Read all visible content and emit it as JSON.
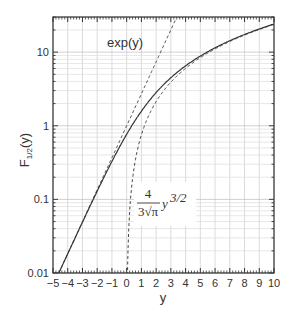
{
  "chart_data": {
    "type": "line",
    "title": "",
    "xlabel": "y",
    "ylabel": "F1/2(y)",
    "ylabel_main": "F",
    "ylabel_sub": "1/2",
    "ylabel_arg": "(y)",
    "xlim": [
      -5,
      10
    ],
    "ylim": [
      0.01,
      30
    ],
    "yscale": "log",
    "grid": true,
    "x_ticks": [
      -5,
      -4,
      -3,
      -2,
      -1,
      0,
      1,
      2,
      3,
      4,
      5,
      6,
      7,
      8,
      9,
      10
    ],
    "x_tick_labels": [
      "−5",
      "−4",
      "−3",
      "−2",
      "−1",
      "0",
      "1",
      "2",
      "3",
      "4",
      "5",
      "6",
      "7",
      "8",
      "9",
      "10"
    ],
    "y_ticks": [
      0.01,
      0.1,
      1,
      10
    ],
    "y_tick_labels": [
      "0.01",
      "0.1",
      "1",
      "10"
    ],
    "annotations": [
      {
        "text": "exp(y)",
        "x": 1.2,
        "y": 15
      },
      {
        "text": "4/(3√π) y^(3/2)",
        "numerator": "4",
        "denominator": "3√π",
        "term": "y",
        "exponent": "3/2",
        "x": 0.6,
        "y": 0.12
      }
    ],
    "series": [
      {
        "name": "F1/2(y)",
        "style": "solid",
        "x": [
          -4.6,
          -4,
          -3,
          -2,
          -1,
          0,
          1,
          2,
          3,
          4,
          5,
          6,
          7,
          8,
          9,
          10
        ],
        "y": [
          0.01,
          0.018,
          0.049,
          0.131,
          0.343,
          0.765,
          1.576,
          2.824,
          4.488,
          6.515,
          8.87,
          11.52,
          14.44,
          17.61,
          21.0,
          24.6
        ]
      },
      {
        "name": "exp(y)",
        "style": "dashed",
        "x": [
          -4.6,
          -4,
          -3,
          -2,
          -1,
          0,
          1,
          2,
          3,
          3.3
        ],
        "y": [
          0.01,
          0.018,
          0.0498,
          0.135,
          0.368,
          1.0,
          2.718,
          7.389,
          20.09,
          27.1
        ]
      },
      {
        "name": "4/(3√π) y^(3/2)",
        "style": "dashed",
        "x": [
          0.03,
          0.1,
          0.3,
          0.5,
          1,
          2,
          3,
          4,
          5,
          6,
          7,
          8,
          9,
          10
        ],
        "y": [
          0.0039,
          0.0238,
          0.124,
          0.266,
          0.752,
          2.128,
          3.909,
          6.018,
          8.41,
          11.05,
          13.93,
          17.02,
          20.31,
          23.79
        ]
      }
    ]
  }
}
